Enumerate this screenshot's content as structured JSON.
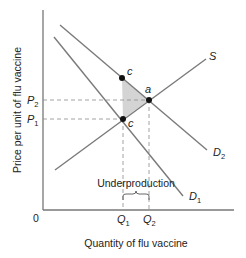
{
  "diagram": {
    "y_axis_label": "Price per unit of flu vaccine",
    "x_axis_label": "Quantity of flu vaccine",
    "origin_label": "0",
    "price_labels": [
      {
        "id": "P2",
        "base": "P",
        "sub": "2"
      },
      {
        "id": "P1",
        "base": "P",
        "sub": "1"
      }
    ],
    "quantity_labels": [
      {
        "id": "Q1",
        "base": "Q",
        "sub": "1"
      },
      {
        "id": "Q2",
        "base": "Q",
        "sub": "2"
      }
    ],
    "curves": [
      {
        "id": "S",
        "label": "S",
        "type": "supply"
      },
      {
        "id": "D1",
        "base": "D",
        "sub": "1",
        "type": "demand (private)"
      },
      {
        "id": "D2",
        "base": "D",
        "sub": "2",
        "type": "demand (social)"
      }
    ],
    "points": [
      {
        "id": "a",
        "label": "a",
        "description": "intersection of S and D2 at (Q2, P2)"
      },
      {
        "id": "b",
        "label": "b",
        "description": "D2 at Q1"
      },
      {
        "id": "c",
        "label": "c",
        "description": "intersection of S and D1 at (Q1, P1)"
      }
    ],
    "shaded_region": "triangle abc (deadweight loss)",
    "annotation": "Underproduction"
  }
}
